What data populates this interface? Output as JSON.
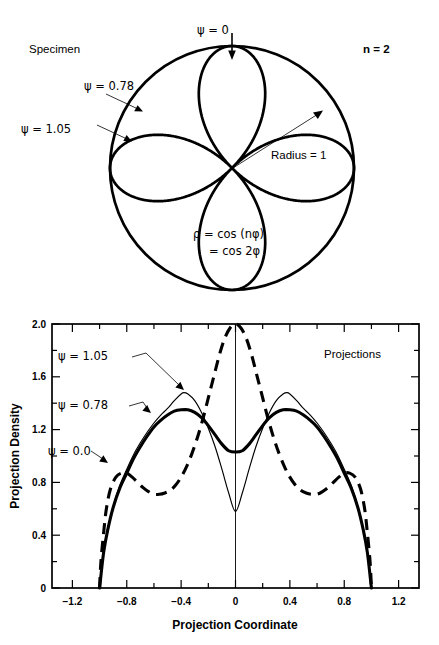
{
  "specimen": {
    "title": "Specimen",
    "n_label": "n = 2",
    "radius_label": "Radius = 1",
    "equation_line1": "ρ = cos (nφ)",
    "equation_line2": "= cos 2φ",
    "psi_top": "ψ = 0",
    "psi_078": "ψ = 0.78",
    "psi_105": "ψ = 1.05",
    "radius_value": 1,
    "n_value": 2,
    "rose_equation": "rho = cos(2*phi)"
  },
  "projections": {
    "panel_title": "Projections",
    "legend_105": "ψ = 1.05",
    "legend_078": "ψ = 0.78",
    "legend_000": "ψ = 0.0"
  },
  "chart_data": {
    "type": "line",
    "title": "Projections",
    "xlabel": "Projection Coordinate",
    "ylabel": "Projection Density",
    "xlim": [
      -1.35,
      1.35
    ],
    "ylim": [
      0.0,
      2.0
    ],
    "xticks": [
      -1.2,
      -0.8,
      -0.4,
      0,
      0.4,
      0.8,
      1.2
    ],
    "xtick_labels": [
      "−1.2",
      "−0.8",
      "−0.4",
      "0",
      "0.4",
      "0.8",
      "1.2"
    ],
    "yticks": [
      0,
      0.4,
      0.8,
      1.2,
      1.6,
      2.0
    ],
    "ytick_labels": [
      "0",
      "0.4",
      "0.8",
      "1.2",
      "1.6",
      "2.0"
    ],
    "minor_tick_step_x": 0.2,
    "minor_tick_step_y": 0.2,
    "grid": false,
    "legend_position": "in-plot-annotations",
    "series": [
      {
        "name": "ψ = 1.05",
        "style": "thin-solid",
        "x": [
          -1.0,
          -0.97,
          -0.94,
          -0.9,
          -0.85,
          -0.8,
          -0.75,
          -0.7,
          -0.65,
          -0.6,
          -0.55,
          -0.5,
          -0.45,
          -0.4,
          -0.38,
          -0.35,
          -0.3,
          -0.25,
          -0.2,
          -0.15,
          -0.1,
          -0.05,
          0.0,
          0.05,
          0.1,
          0.15,
          0.2,
          0.25,
          0.3,
          0.35,
          0.38,
          0.4,
          0.45,
          0.5,
          0.55,
          0.6,
          0.65,
          0.7,
          0.75,
          0.8,
          0.85,
          0.9,
          0.94,
          0.97,
          1.0
        ],
        "y": [
          0.0,
          0.28,
          0.45,
          0.62,
          0.78,
          0.9,
          1.01,
          1.1,
          1.18,
          1.25,
          1.31,
          1.36,
          1.42,
          1.47,
          1.48,
          1.47,
          1.42,
          1.33,
          1.21,
          1.07,
          0.9,
          0.72,
          0.58,
          0.72,
          0.9,
          1.07,
          1.21,
          1.33,
          1.42,
          1.47,
          1.48,
          1.47,
          1.42,
          1.36,
          1.31,
          1.25,
          1.18,
          1.1,
          1.01,
          0.9,
          0.78,
          0.62,
          0.45,
          0.28,
          0.0
        ]
      },
      {
        "name": "ψ = 0.78",
        "style": "thick-solid",
        "x": [
          -1.0,
          -0.97,
          -0.94,
          -0.9,
          -0.85,
          -0.8,
          -0.75,
          -0.7,
          -0.65,
          -0.6,
          -0.55,
          -0.5,
          -0.45,
          -0.4,
          -0.35,
          -0.3,
          -0.25,
          -0.2,
          -0.15,
          -0.1,
          -0.05,
          0.0,
          0.05,
          0.1,
          0.15,
          0.2,
          0.25,
          0.3,
          0.35,
          0.4,
          0.45,
          0.5,
          0.55,
          0.6,
          0.65,
          0.7,
          0.75,
          0.8,
          0.85,
          0.9,
          0.94,
          0.97,
          1.0
        ],
        "y": [
          0.0,
          0.27,
          0.44,
          0.61,
          0.76,
          0.87,
          0.98,
          1.07,
          1.15,
          1.22,
          1.27,
          1.31,
          1.34,
          1.35,
          1.35,
          1.33,
          1.29,
          1.23,
          1.16,
          1.09,
          1.04,
          1.03,
          1.04,
          1.09,
          1.16,
          1.23,
          1.29,
          1.33,
          1.35,
          1.35,
          1.34,
          1.31,
          1.27,
          1.22,
          1.15,
          1.07,
          0.98,
          0.87,
          0.76,
          0.61,
          0.44,
          0.27,
          0.0
        ]
      },
      {
        "name": "ψ = 0.0",
        "style": "thick-dashed",
        "x": [
          -1.0,
          -0.99,
          -0.97,
          -0.95,
          -0.92,
          -0.88,
          -0.84,
          -0.8,
          -0.76,
          -0.72,
          -0.68,
          -0.64,
          -0.6,
          -0.56,
          -0.52,
          -0.48,
          -0.44,
          -0.4,
          -0.36,
          -0.32,
          -0.28,
          -0.24,
          -0.2,
          -0.16,
          -0.12,
          -0.08,
          -0.04,
          0.0,
          0.04,
          0.08,
          0.12,
          0.16,
          0.2,
          0.24,
          0.28,
          0.32,
          0.36,
          0.4,
          0.44,
          0.48,
          0.52,
          0.56,
          0.6,
          0.64,
          0.68,
          0.72,
          0.76,
          0.8,
          0.84,
          0.88,
          0.92,
          0.95,
          0.97,
          0.99,
          1.0
        ],
        "y": [
          0.0,
          0.2,
          0.42,
          0.6,
          0.75,
          0.84,
          0.87,
          0.87,
          0.84,
          0.8,
          0.76,
          0.73,
          0.71,
          0.71,
          0.72,
          0.74,
          0.78,
          0.84,
          0.92,
          1.02,
          1.14,
          1.28,
          1.44,
          1.6,
          1.76,
          1.89,
          1.97,
          2.0,
          1.97,
          1.89,
          1.76,
          1.6,
          1.44,
          1.28,
          1.14,
          1.02,
          0.92,
          0.84,
          0.78,
          0.74,
          0.72,
          0.71,
          0.71,
          0.73,
          0.76,
          0.8,
          0.84,
          0.87,
          0.87,
          0.84,
          0.75,
          0.6,
          0.42,
          0.2,
          0.0
        ]
      }
    ]
  }
}
